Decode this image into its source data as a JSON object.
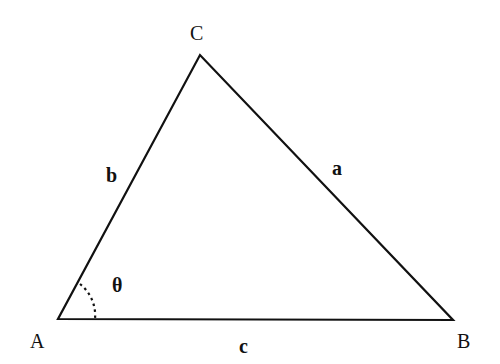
{
  "diagram": {
    "type": "triangle",
    "vertices": [
      {
        "name": "A",
        "label": "A"
      },
      {
        "name": "B",
        "label": "B"
      },
      {
        "name": "C",
        "label": "C"
      }
    ],
    "sides": [
      {
        "name": "a",
        "label": "a",
        "between": "B-C"
      },
      {
        "name": "b",
        "label": "b",
        "between": "A-C"
      },
      {
        "name": "c",
        "label": "c",
        "between": "A-B"
      }
    ],
    "angle": {
      "vertex": "A",
      "label": "θ",
      "style": "dotted-arc"
    },
    "colors": {
      "line": "#111111",
      "background": "#ffffff"
    }
  }
}
